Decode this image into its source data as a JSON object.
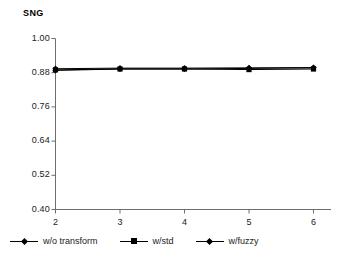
{
  "chart_data": {
    "type": "line",
    "title": "SNG",
    "xlabel": "",
    "ylabel": "",
    "x": [
      2,
      3,
      4,
      5,
      6
    ],
    "categories": [
      "2",
      "3",
      "4",
      "5",
      "6"
    ],
    "xtick_labels": [
      "2",
      "3",
      "4",
      "5",
      "6"
    ],
    "ytick_labels": [
      "1.00",
      "0.88",
      "0.76",
      "0.64",
      "0.52",
      "0.40"
    ],
    "ytick_values": [
      1.0,
      0.88,
      0.76,
      0.64,
      0.52,
      0.4
    ],
    "ylim": [
      0.4,
      1.0
    ],
    "xlim": [
      2,
      6
    ],
    "grid": false,
    "legend_position": "bottom-left",
    "series": [
      {
        "name": "w/o transform",
        "marker": "diamond",
        "color": "#000000",
        "values": [
          0.894,
          0.896,
          0.896,
          0.897,
          0.898
        ]
      },
      {
        "name": "w/std",
        "marker": "square",
        "color": "#000000",
        "values": [
          0.89,
          0.893,
          0.893,
          0.891,
          0.893
        ]
      },
      {
        "name": "w/fuzzy",
        "marker": "diamond",
        "color": "#000000",
        "values": [
          0.888,
          0.893,
          0.893,
          0.895,
          0.897
        ]
      }
    ]
  },
  "legend": {
    "items": [
      {
        "label": "w/o transform",
        "marker": "diamond"
      },
      {
        "label": "w/std",
        "marker": "square"
      },
      {
        "label": "w/fuzzy",
        "marker": "diamond"
      }
    ]
  },
  "axes": {
    "axis_color": "#6e6e6e",
    "line_color": "#000000"
  }
}
